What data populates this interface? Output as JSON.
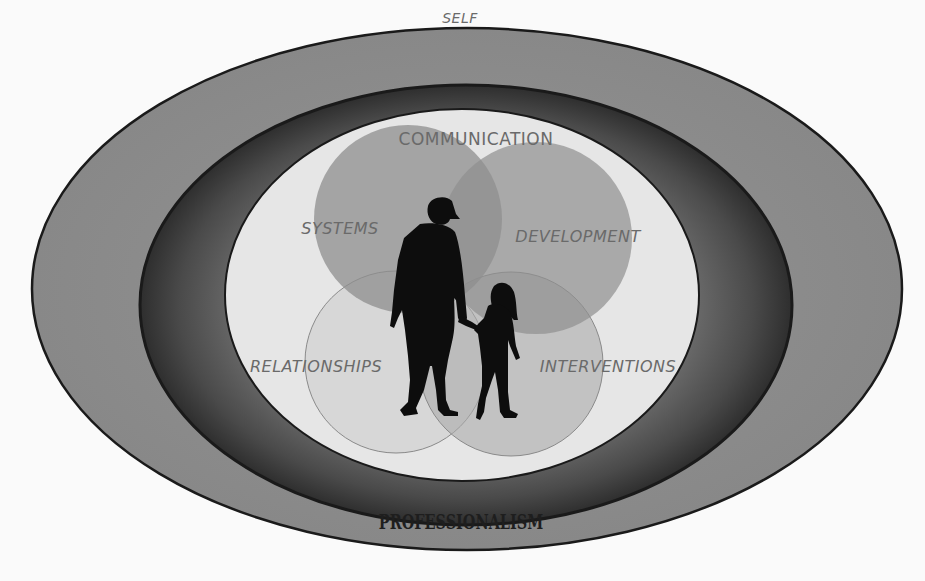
{
  "diagram": {
    "type": "nested-ellipses-with-venn",
    "outer_ring": {
      "label": "SELF",
      "color": "#8e8e8e"
    },
    "middle_ring": {
      "label": "PROFESSIONALISM",
      "color": "#555555"
    },
    "inner_area": {
      "label": "COMMUNICATION",
      "color": "#e6e6e6"
    },
    "venn": [
      {
        "id": "systems",
        "label": "SYSTEMS",
        "color": "#9a9a9a"
      },
      {
        "id": "development",
        "label": "DEVELOPMENT",
        "color": "#9a9a9a"
      },
      {
        "id": "relationships",
        "label": "RELATIONSHIPS",
        "color": "#d6d6d6"
      },
      {
        "id": "interventions",
        "label": "INTERVENTIONS",
        "color": "#b8b8b8"
      }
    ],
    "center_figure": "adult-and-child-silhouette"
  }
}
